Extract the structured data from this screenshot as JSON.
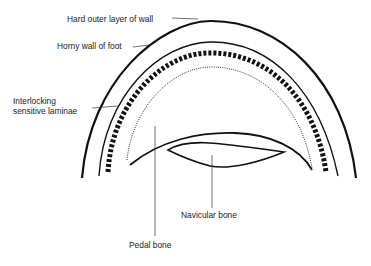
{
  "diagram": {
    "labels": {
      "outer_wall": "Hard outer layer of wall",
      "horny_wall": "Horny wall of foot",
      "laminae_1": "Interlocking",
      "laminae_2": "sensitive laminae",
      "navicular": "Navicular bone",
      "pedal": "Pedal bone"
    }
  }
}
